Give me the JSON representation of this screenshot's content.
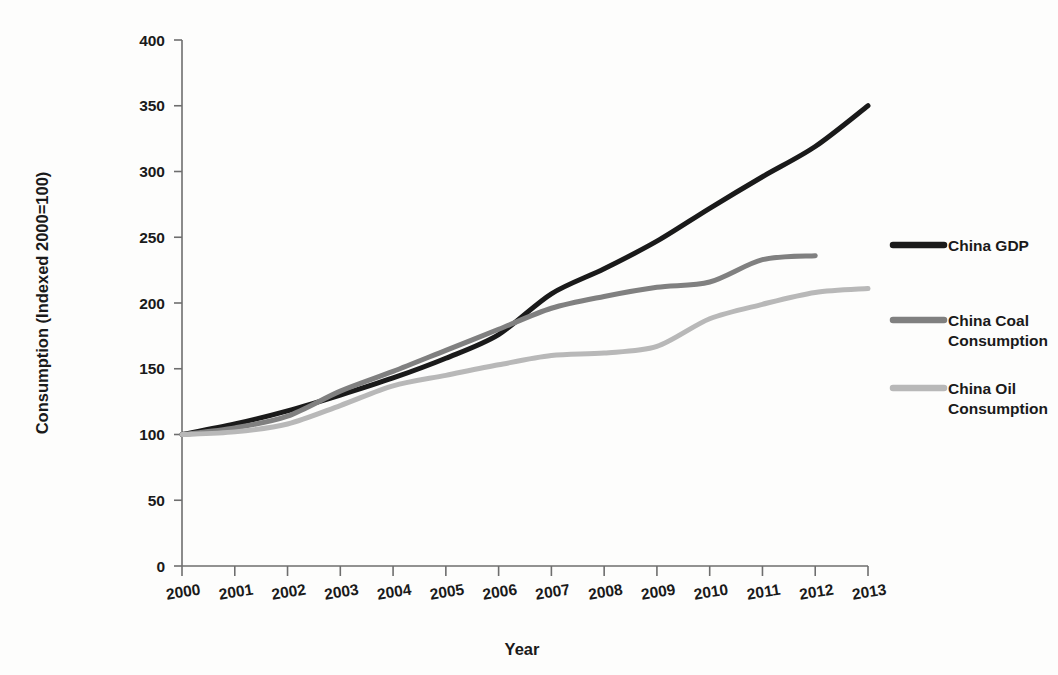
{
  "chart_data": {
    "type": "line",
    "title": "",
    "xlabel": "Year",
    "ylabel": "Consumption (Indexed 2000=100)",
    "categories": [
      "2000",
      "2001",
      "2002",
      "2003",
      "2004",
      "2005",
      "2006",
      "2007",
      "2008",
      "2009",
      "2010",
      "2011",
      "2012",
      "2013"
    ],
    "x": [
      2000,
      2001,
      2002,
      2003,
      2004,
      2005,
      2006,
      2007,
      2008,
      2009,
      2010,
      2011,
      2012,
      2013
    ],
    "xlim": [
      2000,
      2013
    ],
    "ylim": [
      0,
      400
    ],
    "yticks": [
      0,
      50,
      100,
      150,
      200,
      250,
      300,
      350,
      400
    ],
    "ytick_labels": [
      "0",
      "50",
      "100",
      "150",
      "200",
      "250",
      "300",
      "350",
      "400"
    ],
    "grid": false,
    "legend_position": "right",
    "series": [
      {
        "name": "China GDP",
        "color": "#1a1a1a",
        "width": 5.0,
        "values": [
          100,
          108,
          118,
          130,
          143,
          158,
          176,
          207,
          226,
          247,
          272,
          296,
          319,
          350
        ]
      },
      {
        "name": "China Coal Consumption",
        "color": "#808080",
        "width": 5.0,
        "values": [
          100,
          105,
          114,
          133,
          148,
          164,
          180,
          196,
          205,
          212,
          216,
          233,
          236,
          null
        ]
      },
      {
        "name": "China Oil Consumption",
        "color": "#b8b8b8",
        "width": 5.0,
        "values": [
          100,
          102,
          108,
          122,
          137,
          145,
          153,
          160,
          162,
          167,
          188,
          199,
          208,
          211
        ]
      }
    ]
  },
  "axes": {
    "y_title": "Consumption (Indexed 2000=100)",
    "x_title": "Year"
  },
  "legend": {
    "items": [
      {
        "label": "China GDP",
        "label_line1": "China GDP",
        "label_line2": "",
        "color": "#1a1a1a"
      },
      {
        "label": "China Coal Consumption",
        "label_line1": "China Coal",
        "label_line2": "Consumption",
        "color": "#808080"
      },
      {
        "label": "China Oil Consumption",
        "label_line1": "China Oil",
        "label_line2": "Consumption",
        "color": "#b8b8b8"
      }
    ]
  }
}
